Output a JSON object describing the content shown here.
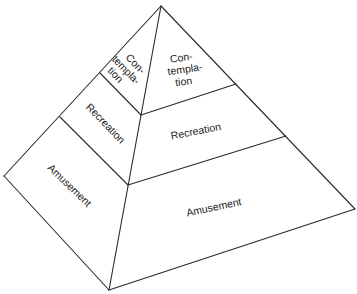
{
  "diagram": {
    "type": "pyramid",
    "levels": [
      {
        "name": "Contemplation",
        "left_face_lines": [
          "Con-",
          "templa-",
          "tion"
        ],
        "right_face_lines": [
          "Con-",
          "templa-",
          "tion"
        ],
        "position": "top"
      },
      {
        "name": "Recreation",
        "left_face_lines": [
          "Recreation"
        ],
        "right_face_lines": [
          "Recreation"
        ],
        "position": "middle"
      },
      {
        "name": "Amusement",
        "left_face_lines": [
          "Amusement"
        ],
        "right_face_lines": [
          "Amusement"
        ],
        "position": "bottom"
      }
    ],
    "colors": {
      "line": "#2a2a2a",
      "text": "#1a1a1a",
      "background": "#ffffff"
    }
  }
}
